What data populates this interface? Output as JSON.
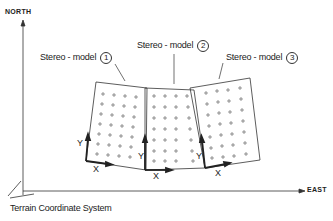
{
  "axes": {
    "north": "NORTH",
    "east": "EAST"
  },
  "caption": "Terrain Coordinate System",
  "models": [
    {
      "label": "Stereo - model",
      "number": "1"
    },
    {
      "label": "Stereo - model",
      "number": "2"
    },
    {
      "label": "Stereo - model",
      "number": "3"
    }
  ],
  "local_axes": {
    "x": "X",
    "y": "Y"
  },
  "colors": {
    "line": "#333333",
    "background": "#ffffff"
  }
}
